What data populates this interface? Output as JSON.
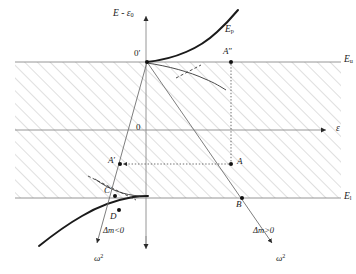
{
  "figure": {
    "axes": {
      "y_label": "E - ε",
      "y_label_sub": "0",
      "x_label": "ε",
      "origin_label": "0",
      "shifted_origin_label": "0′"
    },
    "band_edges": [
      {
        "name": "upper-band-edge",
        "label": "E",
        "sub": "u",
        "y_px": 62
      },
      {
        "name": "lower-band-edge",
        "label": "E",
        "sub": "l",
        "y_px": 198
      }
    ],
    "curves": [
      {
        "name": "Ep-curve",
        "label": "E",
        "sub": "p"
      }
    ],
    "points": [
      {
        "name": "point-A-double-prime",
        "label": "A",
        "prime": "″",
        "x_px": 231,
        "y_px": 62
      },
      {
        "name": "point-A",
        "label": "A",
        "prime": "",
        "x_px": 231,
        "y_px": 164
      },
      {
        "name": "point-A-prime",
        "label": "A",
        "prime": "′",
        "x_px": 120,
        "y_px": 164
      },
      {
        "name": "point-B",
        "label": "B",
        "prime": "",
        "x_px": 242,
        "y_px": 198
      },
      {
        "name": "point-C",
        "label": "C",
        "prime": "",
        "x_px": 112,
        "y_px": 196
      },
      {
        "name": "point-D",
        "label": "D",
        "prime": "",
        "x_px": 116,
        "y_px": 209
      }
    ],
    "branch_labels": [
      {
        "name": "negative-mass-branch",
        "text": "Δm<0"
      },
      {
        "name": "positive-mass-branch",
        "text": "Δm>0"
      }
    ],
    "omega_labels": [
      {
        "name": "omega-squared-left",
        "base": "ω",
        "exp": "2"
      },
      {
        "name": "omega-squared-right",
        "base": "ω",
        "exp": "2"
      }
    ],
    "colors": {
      "curve_heavy": "#1a1a1a",
      "axis": "#8b8b8b",
      "hatch": "#b9b9b9",
      "branch": "#6f6f6f",
      "text": "#1a1a1a",
      "background": "#ffffff"
    }
  }
}
